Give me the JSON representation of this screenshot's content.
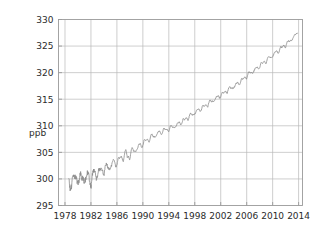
{
  "chart_data": {
    "type": "line",
    "title": "",
    "subtitle": "",
    "xlabel": "",
    "ylabel": "ppb",
    "xlim": [
      1977.0,
      2014.6
    ],
    "ylim": [
      295,
      330
    ],
    "grid": true,
    "legend": null,
    "legend_position": "none",
    "x_ticks": [
      1978,
      1982,
      1986,
      1990,
      1994,
      1998,
      2002,
      2006,
      2010,
      2014
    ],
    "x_tick_labels": [
      "1978",
      "1982",
      "1986",
      "1990",
      "1994",
      "1998",
      "2002",
      "2006",
      "2010",
      "2014"
    ],
    "y_ticks": [
      295,
      300,
      305,
      310,
      315,
      320,
      325,
      330
    ],
    "y_tick_labels": [
      "295",
      "300",
      "305",
      "310",
      "315",
      "320",
      "325",
      "330"
    ],
    "line_color": "#8a8a8a",
    "grid_color": "#b9b9b9",
    "axis_color": "#9a9a9a",
    "background_color": "#ffffff",
    "series": [
      {
        "name": "N2O concentration",
        "units": "ppb",
        "x": [
          1978.6,
          1978.8,
          1979.0,
          1979.2,
          1979.4,
          1979.6,
          1979.8,
          1980.0,
          1980.2,
          1980.4,
          1980.6,
          1980.8,
          1981.0,
          1981.2,
          1981.4,
          1981.6,
          1981.8,
          1982.0,
          1982.2,
          1982.4,
          1982.6,
          1982.8,
          1983.0,
          1983.2,
          1983.4,
          1983.6,
          1983.8,
          1984.0,
          1984.2,
          1984.4,
          1984.6,
          1984.8,
          1985.0,
          1985.2,
          1985.4,
          1985.6,
          1985.8,
          1986.0,
          1986.2,
          1986.4,
          1986.6,
          1986.8,
          1987.0,
          1987.2,
          1987.4,
          1987.6,
          1987.8,
          1988.0,
          1988.2,
          1988.4,
          1988.6,
          1988.8,
          1989.0,
          1989.2,
          1989.4,
          1989.6,
          1989.8,
          1990.0,
          1990.2,
          1990.4,
          1990.6,
          1990.8,
          1991.0,
          1991.2,
          1991.4,
          1991.6,
          1991.8,
          1992.0,
          1992.2,
          1992.4,
          1992.6,
          1992.8,
          1993.0,
          1993.2,
          1993.4,
          1993.6,
          1993.8,
          1994.0,
          1994.2,
          1994.4,
          1994.6,
          1994.8,
          1995.0,
          1995.2,
          1995.4,
          1995.6,
          1995.8,
          1996.0,
          1996.2,
          1996.4,
          1996.6,
          1996.8,
          1997.0,
          1997.2,
          1997.4,
          1997.6,
          1997.8,
          1998.0,
          1998.2,
          1998.4,
          1998.6,
          1998.8,
          1999.0,
          1999.2,
          1999.4,
          1999.6,
          1999.8,
          2000.0,
          2000.2,
          2000.4,
          2000.6,
          2000.8,
          2001.0,
          2001.2,
          2001.4,
          2001.6,
          2001.8,
          2002.0,
          2002.2,
          2002.4,
          2002.6,
          2002.8,
          2003.0,
          2003.2,
          2003.4,
          2003.6,
          2003.8,
          2004.0,
          2004.2,
          2004.4,
          2004.6,
          2004.8,
          2005.0,
          2005.2,
          2005.4,
          2005.6,
          2005.8,
          2006.0,
          2006.2,
          2006.4,
          2006.6,
          2006.8,
          2007.0,
          2007.2,
          2007.4,
          2007.6,
          2007.8,
          2008.0,
          2008.2,
          2008.4,
          2008.6,
          2008.8,
          2009.0,
          2009.2,
          2009.4,
          2009.6,
          2009.8,
          2010.0,
          2010.2,
          2010.4,
          2010.6,
          2010.8,
          2011.0,
          2011.2,
          2011.4,
          2011.6,
          2011.8,
          2012.0,
          2012.2,
          2012.4,
          2012.6,
          2012.8,
          2013.0,
          2013.2,
          2013.4,
          2013.6,
          2013.8
        ],
        "y": [
          299.5,
          298.9,
          299.6,
          300.2,
          299.4,
          299.9,
          300.5,
          300.1,
          299.4,
          300.3,
          300.0,
          300.6,
          300.2,
          299.6,
          300.5,
          300.8,
          300.2,
          299.1,
          300.4,
          300.8,
          301.3,
          300.6,
          301.0,
          301.5,
          300.9,
          301.6,
          302.0,
          301.4,
          301.9,
          302.4,
          301.8,
          302.3,
          302.7,
          302.2,
          302.9,
          303.4,
          302.8,
          303.2,
          303.7,
          303.3,
          304.0,
          304.4,
          303.9,
          304.6,
          305.0,
          303.9,
          304.6,
          304.2,
          305.1,
          305.4,
          305.0,
          305.6,
          305.9,
          305.5,
          306.1,
          306.5,
          306.2,
          306.8,
          307.1,
          306.8,
          307.3,
          307.6,
          307.4,
          307.8,
          308.1,
          307.8,
          308.2,
          308.5,
          308.2,
          308.6,
          308.9,
          308.6,
          309.0,
          309.3,
          309.0,
          309.2,
          309.5,
          309.3,
          309.6,
          309.8,
          309.6,
          309.9,
          310.1,
          309.9,
          310.3,
          310.6,
          310.4,
          310.8,
          311.1,
          310.9,
          311.3,
          311.6,
          311.4,
          311.8,
          312.1,
          311.9,
          312.3,
          312.6,
          312.4,
          312.8,
          313.1,
          312.9,
          313.3,
          313.6,
          313.4,
          313.8,
          314.1,
          313.9,
          314.3,
          314.6,
          314.4,
          314.8,
          315.1,
          314.9,
          315.3,
          315.6,
          315.4,
          315.8,
          316.1,
          315.9,
          316.3,
          316.6,
          316.5,
          316.8,
          317.1,
          316.9,
          317.3,
          317.5,
          317.3,
          317.8,
          318.1,
          317.9,
          318.4,
          318.7,
          318.5,
          319.0,
          319.3,
          319.2,
          319.6,
          319.9,
          319.8,
          320.2,
          320.4,
          320.3,
          320.7,
          321.0,
          320.9,
          321.3,
          321.6,
          321.5,
          321.9,
          322.2,
          322.1,
          322.5,
          322.8,
          322.7,
          323.1,
          323.4,
          323.3,
          323.7,
          324.0,
          323.9,
          324.3,
          324.6,
          324.5,
          324.9,
          325.2,
          325.1,
          325.5,
          325.8,
          325.7,
          326.2,
          326.5,
          326.4,
          326.9,
          327.2,
          327.5
        ]
      }
    ]
  },
  "axes": {
    "y_axis_title": "ppb"
  }
}
